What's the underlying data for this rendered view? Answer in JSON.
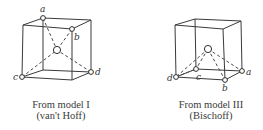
{
  "figures": [
    {
      "id": "model-1",
      "caption_line1": "From model I",
      "caption_line2": "(van't Hoff)",
      "vertex_labels": [
        "a",
        "b",
        "c",
        "d"
      ]
    },
    {
      "id": "model-3",
      "caption_line1": "From model III",
      "caption_line2": "(Bischoff)",
      "vertex_labels": [
        "a",
        "b",
        "c",
        "d"
      ]
    }
  ]
}
